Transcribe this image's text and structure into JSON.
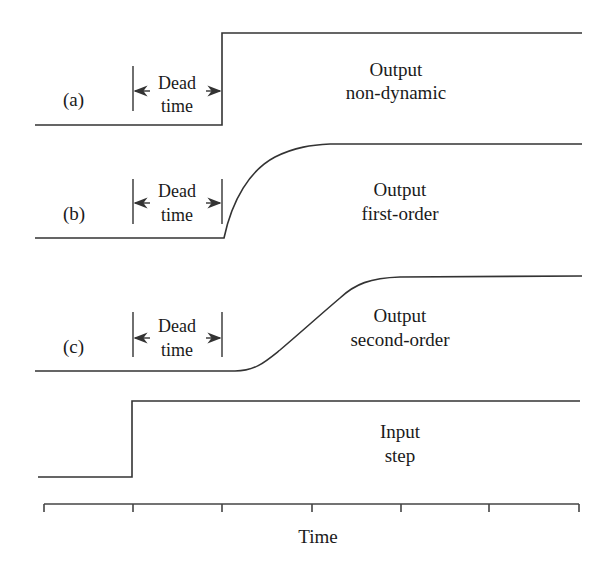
{
  "figure": {
    "type": "response-comparison",
    "colors": {
      "line": "#333333",
      "text": "#1a1a1a",
      "background": "#ffffff"
    },
    "edge_fragment": "t",
    "panels": [
      {
        "id": "a",
        "tag": "(a)",
        "title": "Output",
        "subtitle": "non-dynamic",
        "response": "step",
        "dead_time_label_1": "Dead",
        "dead_time_label_2": "time"
      },
      {
        "id": "b",
        "tag": "(b)",
        "title": "Output",
        "subtitle": "first-order",
        "response": "first-order",
        "dead_time_label_1": "Dead",
        "dead_time_label_2": "time"
      },
      {
        "id": "c",
        "tag": "(c)",
        "title": "Output",
        "subtitle": "second-order",
        "response": "second-order",
        "dead_time_label_1": "Dead",
        "dead_time_label_2": "time"
      },
      {
        "id": "input",
        "tag": "",
        "title": "Input",
        "subtitle": "step",
        "response": "step"
      }
    ],
    "axis": {
      "label": "Time",
      "tick_count": 7
    }
  }
}
